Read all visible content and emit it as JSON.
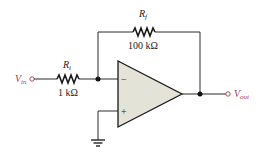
{
  "diagram": {
    "colors": {
      "wire": "#2a2a2a",
      "opamp_fill": "#e3e3d8",
      "signal_label": "#a23a55"
    },
    "input": {
      "label_main": "V",
      "label_sub": "in"
    },
    "output": {
      "label_main": "V",
      "label_sub": "out"
    },
    "input_resistor": {
      "label_main": "R",
      "label_sub": "i",
      "value": "1 kΩ"
    },
    "feedback_resistor": {
      "label_main": "R",
      "label_sub": "f",
      "value": "100 kΩ"
    },
    "opamp": {
      "inverting_sign": "−",
      "noninverting_sign": "+"
    }
  }
}
